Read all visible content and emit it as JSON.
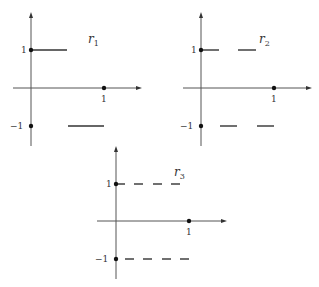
{
  "figure": {
    "panels": [
      {
        "name": "r1",
        "label_main": "r",
        "label_sub": "1",
        "y_tick_pos": "1",
        "y_tick_neg": "−1",
        "x_tick": "1",
        "segments_upper": [
          [
            0,
            0.5
          ]
        ],
        "segments_lower": [
          [
            0.5,
            1
          ]
        ]
      },
      {
        "name": "r2",
        "label_main": "r",
        "label_sub": "2",
        "y_tick_pos": "1",
        "y_tick_neg": "−1",
        "x_tick": "1",
        "segments_upper": [
          [
            0,
            0.25
          ],
          [
            0.5,
            0.75
          ]
        ],
        "segments_lower": [
          [
            0.25,
            0.5
          ],
          [
            0.75,
            1
          ]
        ]
      },
      {
        "name": "r3",
        "label_main": "r",
        "label_sub": "3",
        "y_tick_pos": "1",
        "y_tick_neg": "−1",
        "x_tick": "1",
        "segments_upper": [
          [
            0,
            0.125
          ],
          [
            0.25,
            0.375
          ],
          [
            0.5,
            0.625
          ],
          [
            0.75,
            0.875
          ]
        ],
        "segments_lower": [
          [
            0.125,
            0.25
          ],
          [
            0.375,
            0.5
          ],
          [
            0.625,
            0.75
          ],
          [
            0.875,
            1
          ]
        ]
      }
    ]
  }
}
